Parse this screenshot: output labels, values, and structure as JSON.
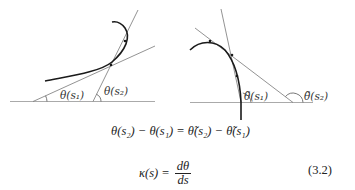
{
  "figure": {
    "left_panel": {
      "labels": {
        "theta_s1": "θ(s₁)",
        "theta_s2": "θ(s₂)"
      }
    },
    "right_panel": {
      "labels": {
        "theta_tilde_s1": "θ̃(s₁)",
        "theta_tilde_s2": "θ̃(s₂)"
      }
    },
    "colors": {
      "curve": "#1a1a1a",
      "tangent": "#777777",
      "baseline": "#aaaaaa"
    }
  },
  "equations": {
    "eq1": "θ(s₂) − θ(s₁) = θ̃(s₂) − θ̃(s₁)",
    "eq2_lhs": "κ(s) =",
    "eq2_num": "dθ",
    "eq2_den": "ds",
    "eq2_number": "(3.2)"
  }
}
